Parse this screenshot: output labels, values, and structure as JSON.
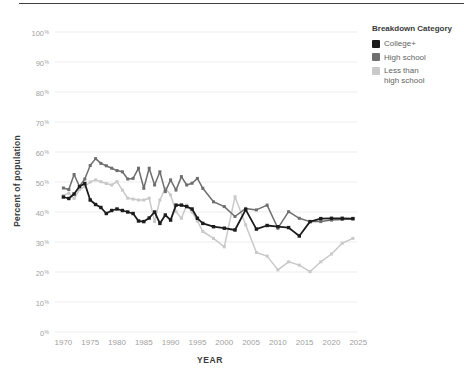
{
  "header": {
    "top_rule_color": "#3f3f3f"
  },
  "chart_data": {
    "type": "line",
    "title": "",
    "xlabel": "YEAR",
    "ylabel": "Percent of population",
    "xlim": [
      1968,
      2026.5
    ],
    "ylim": [
      0,
      100
    ],
    "grid": "horizontal",
    "x_ticks": [
      "1970",
      "1975",
      "1980",
      "1985",
      "1990",
      "1995",
      "2000",
      "2005",
      "2010",
      "2015",
      "2020",
      "2025"
    ],
    "y_ticks": [
      100,
      90,
      80,
      70,
      60,
      50,
      40,
      30,
      20,
      10,
      0
    ],
    "y_tick_suffix": "%",
    "legend": {
      "title": "Breakdown Category",
      "position": "top-right"
    },
    "years": [
      1970,
      1971,
      1972,
      1973,
      1974,
      1975,
      1976,
      1977,
      1978,
      1979,
      1980,
      1981,
      1982,
      1983,
      1984,
      1985,
      1986,
      1987,
      1988,
      1989,
      1990,
      1991,
      1992,
      1993,
      1994,
      1995,
      1996,
      1998,
      2000,
      2002,
      2004,
      2006,
      2008,
      2010,
      2012,
      2014,
      2016,
      2018,
      2020,
      2022,
      2024
    ],
    "series": [
      {
        "name": "College+",
        "color": "#1c1c1c",
        "values": [
          45,
          44.5,
          46,
          48.5,
          49.5,
          44,
          42.5,
          41.5,
          39.5,
          40.5,
          41,
          40.5,
          40,
          39.5,
          37,
          36.8,
          38,
          40,
          36.2,
          39,
          37.3,
          42.3,
          42.3,
          41.8,
          41,
          37.9,
          36.2,
          35.1,
          34.6,
          34,
          40.8,
          34.3,
          35.5,
          35.1,
          34.8,
          32,
          36.8,
          37.8,
          37.9,
          37.9,
          37.8
        ]
      },
      {
        "name": "High school",
        "color": "#6e6e6e",
        "values": [
          48,
          47.5,
          52.5,
          48.5,
          51,
          55.5,
          57.8,
          56.2,
          55.4,
          54.6,
          53.8,
          53.4,
          51,
          51.2,
          54.6,
          47.9,
          54.6,
          49,
          53.4,
          46.8,
          50.7,
          47.3,
          51.8,
          49,
          49.6,
          51.2,
          47.9,
          43.4,
          41.8,
          38.5,
          41.2,
          40.7,
          42.3,
          34.6,
          40.1,
          37.9,
          36.8,
          36.8,
          37.3,
          37.5,
          37.7
        ]
      },
      {
        "name": "Less than high school",
        "color": "#c9c9c9",
        "values": [
          45.5,
          46.3,
          44.5,
          47.5,
          48.5,
          50,
          50.7,
          50.1,
          49.5,
          49,
          50.1,
          47.3,
          44.6,
          44.3,
          44,
          44,
          44.6,
          36.8,
          44,
          47.9,
          45.7,
          40.1,
          37.9,
          42.3,
          40,
          37,
          33.5,
          31.2,
          28.4,
          45.1,
          35.7,
          26.5,
          25.3,
          20.7,
          23.4,
          22.3,
          20.1,
          23.4,
          26,
          29.6,
          31.2
        ]
      }
    ],
    "colors": {
      "grid": "#ededed",
      "tick_text": "#a2a2a2",
      "axis_title": "#3a3a3a"
    }
  }
}
